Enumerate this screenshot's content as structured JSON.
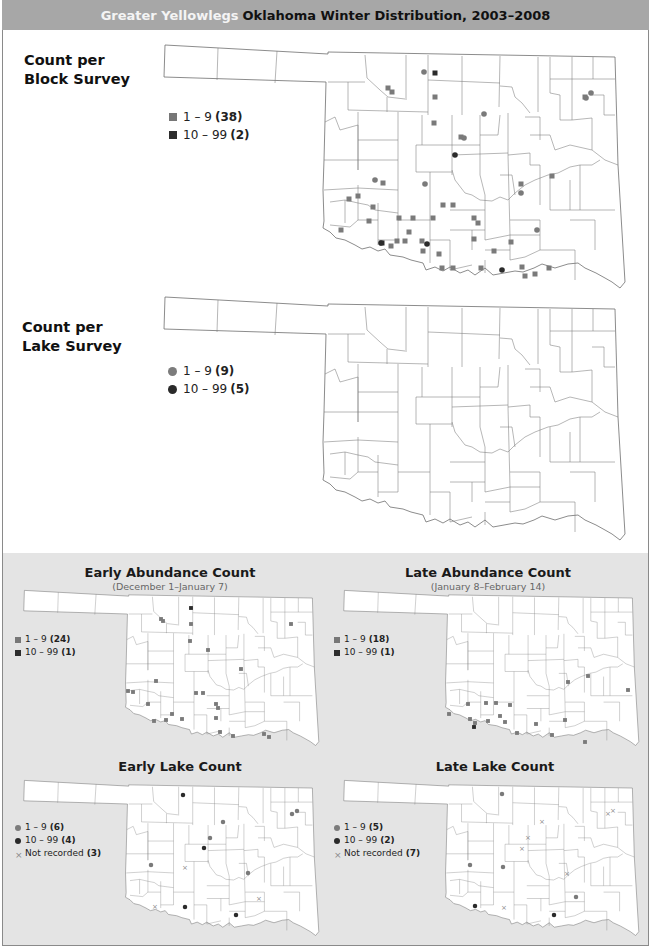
{
  "header": {
    "species": "Greater Yellowlegs",
    "title": "Oklahoma Winter Distribution, 2003–2008",
    "background": "#a7a7a7"
  },
  "colors": {
    "light_marker": "#7a7a7a",
    "dark_marker": "#2b2b2b",
    "not_recorded": "#8a8a8a",
    "panel_bg": "#e4e4e4",
    "county_line": "#6e6e6e"
  },
  "chart_data": [
    {
      "type": "scatter",
      "title": "Count per Block Survey",
      "marker": "square",
      "legend": [
        {
          "label": "1 – 9",
          "count": "38",
          "class": "light"
        },
        {
          "label": "10 – 99",
          "count": "2",
          "class": "dark"
        }
      ],
      "points": [
        [
          388,
          88,
          "l"
        ],
        [
          392,
          92,
          "l"
        ],
        [
          435,
          73,
          "d"
        ],
        [
          435,
          97,
          "l"
        ],
        [
          434,
          123,
          "l"
        ],
        [
          461,
          137,
          "l"
        ],
        [
          585,
          97,
          "l"
        ],
        [
          552,
          176,
          "l"
        ],
        [
          521,
          184,
          "l"
        ],
        [
          383,
          183,
          "l"
        ],
        [
          358,
          196,
          "l"
        ],
        [
          349,
          199,
          "l"
        ],
        [
          373,
          207,
          "l"
        ],
        [
          369,
          221,
          "l"
        ],
        [
          399,
          218,
          "l"
        ],
        [
          413,
          218,
          "l"
        ],
        [
          433,
          218,
          "l"
        ],
        [
          443,
          205,
          "l"
        ],
        [
          453,
          205,
          "l"
        ],
        [
          474,
          218,
          "l"
        ],
        [
          478,
          223,
          "l"
        ],
        [
          341,
          230,
          "l"
        ],
        [
          409,
          232,
          "l"
        ],
        [
          422,
          241,
          "l"
        ],
        [
          397,
          241,
          "l"
        ],
        [
          405,
          241,
          "l"
        ],
        [
          382,
          243,
          "d"
        ],
        [
          391,
          246,
          "l"
        ],
        [
          423,
          251,
          "l"
        ],
        [
          439,
          254,
          "l"
        ],
        [
          474,
          239,
          "l"
        ],
        [
          511,
          242,
          "l"
        ],
        [
          494,
          251,
          "l"
        ],
        [
          442,
          268,
          "l"
        ],
        [
          453,
          268,
          "l"
        ],
        [
          481,
          268,
          "l"
        ],
        [
          522,
          267,
          "l"
        ],
        [
          525,
          276,
          "l"
        ],
        [
          535,
          274,
          "l"
        ],
        [
          549,
          268,
          "l"
        ]
      ]
    },
    {
      "type": "scatter",
      "title": "Count per Lake Survey",
      "marker": "circle",
      "legend": [
        {
          "label": "1 – 9",
          "count": "9",
          "class": "light"
        },
        {
          "label": "10 – 99",
          "count": "5",
          "class": "dark"
        }
      ],
      "points": [
        [
          424,
          72,
          "l"
        ],
        [
          586,
          98,
          "l"
        ],
        [
          591,
          93,
          "l"
        ],
        [
          484,
          114,
          "l"
        ],
        [
          464,
          138,
          "l"
        ],
        [
          455,
          155,
          "d"
        ],
        [
          375,
          180,
          "l"
        ],
        [
          425,
          184,
          "l"
        ],
        [
          521,
          193,
          "l"
        ],
        [
          537,
          230,
          "l"
        ],
        [
          381,
          243,
          "d"
        ],
        [
          427,
          244,
          "d"
        ],
        [
          502,
          270,
          "d"
        ]
      ]
    },
    {
      "type": "scatter",
      "title": "Early Abundance Count",
      "subtitle": "(December 1–January 7)",
      "marker": "square",
      "legend": [
        {
          "label": "1 – 9",
          "count": "24",
          "class": "light"
        },
        {
          "label": "10 – 99",
          "count": "1",
          "class": "dark"
        }
      ],
      "points": [
        [
          191,
          608,
          "d"
        ],
        [
          161,
          619,
          "l"
        ],
        [
          163,
          621,
          "l"
        ],
        [
          191,
          624,
          "l"
        ],
        [
          291,
          624,
          "l"
        ],
        [
          190,
          641,
          "l"
        ],
        [
          208,
          650,
          "l"
        ],
        [
          241,
          669,
          "l"
        ],
        [
          156,
          681,
          "l"
        ],
        [
          133,
          692,
          "l"
        ],
        [
          196,
          693,
          "l"
        ],
        [
          203,
          693,
          "l"
        ],
        [
          216,
          704,
          "l"
        ],
        [
          218,
          708,
          "l"
        ],
        [
          148,
          704,
          "l"
        ],
        [
          172,
          714,
          "l"
        ],
        [
          154,
          721,
          "l"
        ],
        [
          166,
          720,
          "l"
        ],
        [
          182,
          719,
          "l"
        ],
        [
          216,
          718,
          "l"
        ],
        [
          220,
          732,
          "l"
        ],
        [
          233,
          736,
          "l"
        ],
        [
          264,
          734,
          "l"
        ],
        [
          269,
          737,
          "l"
        ],
        [
          128,
          691,
          "l"
        ]
      ]
    },
    {
      "type": "scatter",
      "title": "Late Abundance Count",
      "subtitle": "(January 8–February 14)",
      "marker": "square",
      "legend": [
        {
          "label": "1 – 9",
          "count": "18",
          "class": "light"
        },
        {
          "label": "10 – 99",
          "count": "1",
          "class": "dark"
        }
      ],
      "points": [
        [
          588,
          676,
          "l"
        ],
        [
          568,
          682,
          "l"
        ],
        [
          468,
          704,
          "l"
        ],
        [
          486,
          703,
          "l"
        ],
        [
          496,
          703,
          "l"
        ],
        [
          510,
          705,
          "l"
        ],
        [
          449,
          714,
          "l"
        ],
        [
          475,
          723,
          "l"
        ],
        [
          470,
          719,
          "l"
        ],
        [
          488,
          721,
          "l"
        ],
        [
          505,
          722,
          "l"
        ],
        [
          536,
          724,
          "l"
        ],
        [
          500,
          716,
          "l"
        ],
        [
          474,
          727,
          "d"
        ],
        [
          565,
          720,
          "l"
        ],
        [
          517,
          733,
          "l"
        ],
        [
          552,
          735,
          "l"
        ],
        [
          585,
          742,
          "l"
        ],
        [
          628,
          690,
          "l"
        ]
      ]
    },
    {
      "type": "scatter",
      "title": "Early Lake Count",
      "marker": "circle",
      "legend": [
        {
          "label": "1 – 9",
          "count": "6",
          "class": "light"
        },
        {
          "label": "10 – 99",
          "count": "4",
          "class": "dark"
        },
        {
          "label": "Not recorded",
          "count": "3",
          "class": "x"
        }
      ],
      "points": [
        [
          183,
          795,
          "d"
        ],
        [
          292,
          814,
          "l"
        ],
        [
          297,
          811,
          "l"
        ],
        [
          223,
          822,
          "l"
        ],
        [
          210,
          838,
          "l"
        ],
        [
          204,
          848,
          "d"
        ],
        [
          151,
          865,
          "l"
        ],
        [
          185,
          867,
          "x"
        ],
        [
          248,
          873,
          "l"
        ],
        [
          155,
          906,
          "x"
        ],
        [
          185,
          907,
          "d"
        ],
        [
          236,
          915,
          "d"
        ],
        [
          259,
          898,
          "x"
        ]
      ]
    },
    {
      "type": "scatter",
      "title": "Late Lake Count",
      "marker": "circle",
      "legend": [
        {
          "label": "1 – 9",
          "count": "5",
          "class": "light"
        },
        {
          "label": "10 – 99",
          "count": "2",
          "class": "dark"
        },
        {
          "label": "Not recorded",
          "count": "7",
          "class": "x"
        }
      ],
      "points": [
        [
          502,
          794,
          "l"
        ],
        [
          608,
          813,
          "x"
        ],
        [
          613,
          810,
          "x"
        ],
        [
          542,
          821,
          "x"
        ],
        [
          528,
          837,
          "x"
        ],
        [
          522,
          848,
          "x"
        ],
        [
          470,
          865,
          "l"
        ],
        [
          503,
          867,
          "l"
        ],
        [
          567,
          873,
          "x"
        ],
        [
          475,
          906,
          "d"
        ],
        [
          504,
          907,
          "x"
        ],
        [
          576,
          897,
          "l"
        ],
        [
          554,
          915,
          "d"
        ]
      ]
    }
  ]
}
